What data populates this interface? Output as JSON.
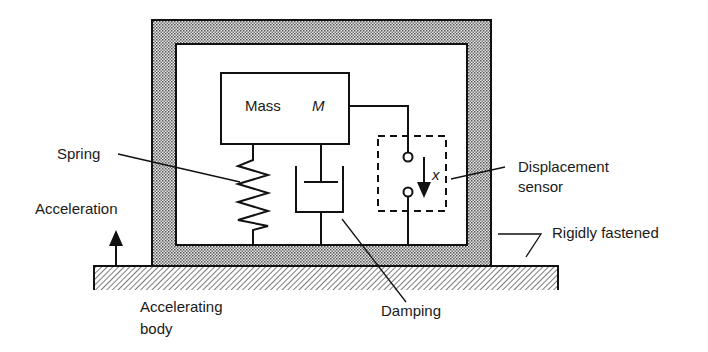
{
  "diagram": {
    "type": "accelerometer-schematic",
    "labels": {
      "mass": "Mass",
      "mass_symbol": "M",
      "spring": "Spring",
      "acceleration": "Acceleration",
      "displacement_line1": "Displacement",
      "displacement_line2": "sensor",
      "displacement_symbol": "x",
      "rigidly_fastened": "Rigidly fastened",
      "accelerating_line1": "Accelerating",
      "accelerating_line2": "body",
      "damping": "Damping"
    },
    "colors": {
      "stroke": "#111111",
      "housing_fill": "#bdbdbd",
      "base_hatch": "#555555",
      "background": "#ffffff"
    },
    "components": [
      "housing",
      "mass",
      "spring",
      "damper",
      "displacement-sensor",
      "accelerating-body"
    ]
  }
}
